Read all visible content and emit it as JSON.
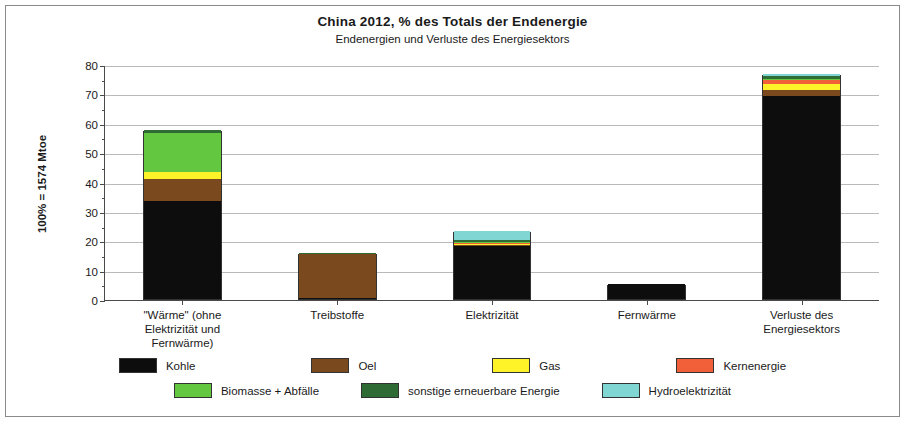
{
  "header": {
    "title": "China  2012,  % des Totals der Endenergie",
    "subtitle": "Endenergien und Verluste des Energiesektors"
  },
  "chart_data": {
    "type": "bar",
    "stacked": true,
    "title": "China  2012,  % des Totals der Endenergie",
    "subtitle": "Endenergien und Verluste des Energiesektors",
    "xlabel": "",
    "ylabel": "100% = 1574 Mtoe",
    "ylim": [
      0,
      80
    ],
    "ytick_step": 10,
    "yticks": [
      "0",
      "10",
      "20",
      "30",
      "40",
      "50",
      "60",
      "70",
      "80"
    ],
    "grid": true,
    "legend_position": "bottom",
    "categories": [
      "\"Wärme\" (ohne Elektrizität und Fernwärme)",
      "Treibstoffe",
      "Elektrizität",
      "Fernwärme",
      "Verluste des Energiesektors"
    ],
    "category_lines": [
      [
        "\"Wärme\" (ohne",
        "Elektrizität und",
        "Fernwärme)"
      ],
      [
        "Treibstoffe"
      ],
      [
        "Elektrizität"
      ],
      [
        "Fernwärme"
      ],
      [
        "Verluste des",
        "Energiesektors"
      ]
    ],
    "series": [
      {
        "name": "Kohle",
        "color": "#0d0d0d",
        "values": [
          33.5,
          0.2,
          18.0,
          5.2,
          69.2
        ]
      },
      {
        "name": "Oel",
        "color": "#7a4a1e",
        "values": [
          7.5,
          15.0,
          0.5,
          0.0,
          2.0
        ]
      },
      {
        "name": "Gas",
        "color": "#fdf328",
        "values": [
          2.3,
          0.0,
          0.3,
          0.0,
          2.1
        ]
      },
      {
        "name": "Kernenergie",
        "color": "#f2603a",
        "values": [
          0.0,
          0.0,
          0.5,
          0.0,
          1.1
        ]
      },
      {
        "name": "Biomasse + Abfälle",
        "color": "#63c council",
        "values": [
          13.2,
          0.0,
          0.2,
          0.0,
          0.4
        ]
      },
      {
        "name": "sonstige erneuerbare Energie",
        "color": "#2f6b34",
        "values": [
          0.9,
          0.3,
          0.6,
          0.0,
          1.0
        ]
      },
      {
        "name": "Hydroelektrizität",
        "color": "#7fd6d2",
        "values": [
          0.0,
          0.0,
          2.9,
          0.0,
          0.8
        ]
      }
    ],
    "totals": [
      57.4,
      15.5,
      23.0,
      5.2,
      76.6
    ]
  },
  "legend": {
    "row1": [
      {
        "label": "Kohle",
        "color": "#0d0d0d"
      },
      {
        "label": "Oel",
        "color": "#7a4a1e"
      },
      {
        "label": "Gas",
        "color": "#fdf328"
      },
      {
        "label": "Kernenergie",
        "color": "#f2603a"
      }
    ],
    "row2": [
      {
        "label": "Biomasse + Abfälle",
        "color": "#63c73f"
      },
      {
        "label": "sonstige erneuerbare Energie",
        "color": "#2f6b34"
      },
      {
        "label": "Hydroelektrizität",
        "color": "#7fd6d2"
      }
    ]
  }
}
